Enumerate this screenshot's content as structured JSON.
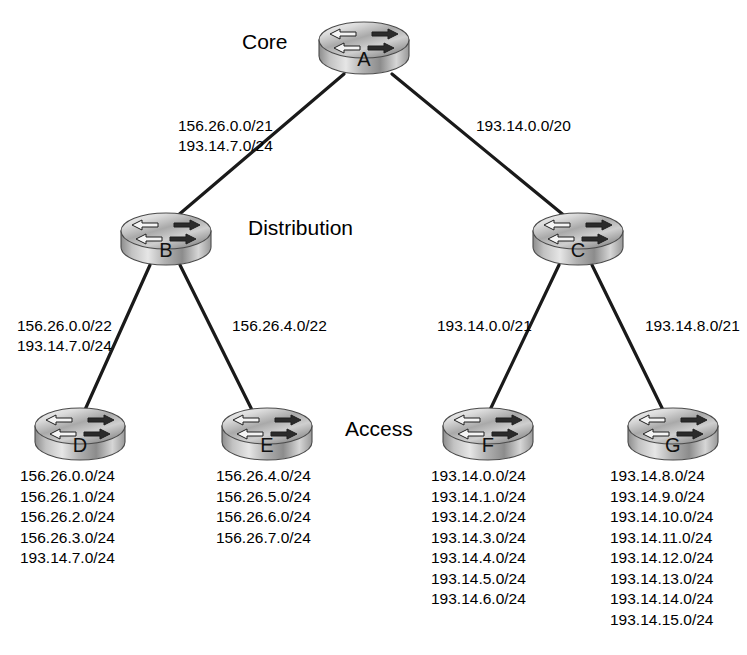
{
  "diagram": {
    "tiers": [
      {
        "id": "core",
        "label": "Core",
        "x": 242,
        "y": 30
      },
      {
        "id": "distribution",
        "label": "Distribution",
        "x": 248,
        "y": 216
      },
      {
        "id": "access",
        "label": "Access",
        "x": 345,
        "y": 417
      }
    ],
    "routers": [
      {
        "id": "A",
        "label": "A",
        "x": 316,
        "y": 18
      },
      {
        "id": "B",
        "label": "B",
        "x": 118,
        "y": 209
      },
      {
        "id": "C",
        "label": "C",
        "x": 530,
        "y": 209
      },
      {
        "id": "D",
        "label": "D",
        "x": 32,
        "y": 404
      },
      {
        "id": "E",
        "label": "E",
        "x": 219,
        "y": 404
      },
      {
        "id": "F",
        "label": "F",
        "x": 440,
        "y": 404
      },
      {
        "id": "G",
        "label": "G",
        "x": 625,
        "y": 404
      }
    ],
    "links": [
      {
        "id": "a-b",
        "from": "A",
        "to": "B",
        "x1": 344,
        "y1": 74,
        "x2": 176,
        "y2": 217
      },
      {
        "id": "a-c",
        "from": "A",
        "to": "C",
        "x1": 392,
        "y1": 74,
        "x2": 566,
        "y2": 217
      },
      {
        "id": "b-d",
        "from": "B",
        "to": "D",
        "x1": 150,
        "y1": 265,
        "x2": 84,
        "y2": 412
      },
      {
        "id": "b-e",
        "from": "B",
        "to": "E",
        "x1": 180,
        "y1": 265,
        "x2": 253,
        "y2": 412
      },
      {
        "id": "c-f",
        "from": "C",
        "to": "F",
        "x1": 559,
        "y1": 265,
        "x2": 489,
        "y2": 412
      },
      {
        "id": "c-g",
        "from": "C",
        "to": "G",
        "x1": 592,
        "y1": 265,
        "x2": 664,
        "y2": 412
      }
    ],
    "link_labels": [
      {
        "id": "label-a-b",
        "link": "a-b",
        "x": 178,
        "y": 116,
        "align": "left",
        "lines": [
          "156.26.0.0/21",
          "193.14.7.0/24"
        ]
      },
      {
        "id": "label-a-c",
        "link": "a-c",
        "x": 476,
        "y": 116,
        "align": "left",
        "lines": [
          "193.14.0.0/20"
        ]
      },
      {
        "id": "label-b-d",
        "link": "b-d",
        "x": 17,
        "y": 316,
        "align": "left",
        "lines": [
          "156.26.0.0/22",
          "193.14.7.0/24"
        ]
      },
      {
        "id": "label-b-e",
        "link": "b-e",
        "x": 232,
        "y": 316,
        "align": "left",
        "lines": [
          "156.26.4.0/22"
        ]
      },
      {
        "id": "label-c-f",
        "link": "c-f",
        "x": 437,
        "y": 316,
        "align": "left",
        "lines": [
          "193.14.0.0/21"
        ]
      },
      {
        "id": "label-c-g",
        "link": "c-g",
        "x": 645,
        "y": 316,
        "align": "left",
        "lines": [
          "193.14.8.0/21"
        ]
      }
    ],
    "subnet_lists": [
      {
        "id": "subnets-D",
        "router": "D",
        "x": 20,
        "y": 466,
        "subnets": [
          "156.26.0.0/24",
          "156.26.1.0/24",
          "156.26.2.0/24",
          "156.26.3.0/24",
          "193.14.7.0/24"
        ]
      },
      {
        "id": "subnets-E",
        "router": "E",
        "x": 216,
        "y": 466,
        "subnets": [
          "156.26.4.0/24",
          "156.26.5.0/24",
          "156.26.6.0/24",
          "156.26.7.0/24"
        ]
      },
      {
        "id": "subnets-F",
        "router": "F",
        "x": 431,
        "y": 466,
        "subnets": [
          "193.14.0.0/24",
          "193.14.1.0/24",
          "193.14.2.0/24",
          "193.14.3.0/24",
          "193.14.4.0/24",
          "193.14.5.0/24",
          "193.14.6.0/24"
        ]
      },
      {
        "id": "subnets-G",
        "router": "G",
        "x": 610,
        "y": 466,
        "subnets": [
          "193.14.8.0/24",
          "193.14.9.0/24",
          "193.14.10.0/24",
          "193.14.11.0/24",
          "193.14.12.0/24",
          "193.14.13.0/24",
          "193.14.14.0/24",
          "193.14.15.0/24"
        ]
      }
    ],
    "colors": {
      "background": "#ffffff",
      "text": "#000000",
      "link_line": "#1a1a1a",
      "router_top_light": "#f2f2f2",
      "router_top_dark": "#8d8d8d",
      "router_body_light": "#e8e8e8",
      "router_body_dark": "#6f6f6f",
      "router_outline": "#4a4a4a"
    }
  }
}
